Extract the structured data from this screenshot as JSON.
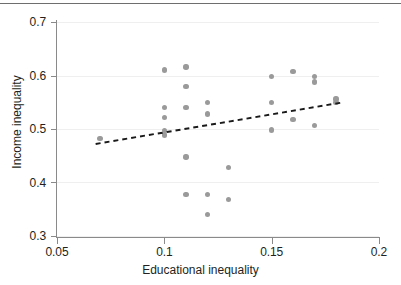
{
  "figure": {
    "name": "scatter-plot-educational-vs-income-inequality",
    "background": "#ffffff",
    "point_color": "#9a9a9a",
    "trendline_color": "#1a1a1a",
    "axis_color": "#8a8a8a",
    "grid_color": "#f0eff0"
  },
  "chart_data": {
    "type": "scatter",
    "title": "",
    "xlabel": "Educational inequality",
    "ylabel": "Income inequality",
    "xlim": [
      0.05,
      0.2
    ],
    "ylim": [
      0.3,
      0.7
    ],
    "xticks": [
      0.05,
      0.1,
      0.15,
      0.2
    ],
    "xticklabels": [
      "0.05",
      "0.1",
      "0.15",
      "0.2"
    ],
    "yticks": [
      0.3,
      0.4,
      0.5,
      0.6,
      0.7
    ],
    "yticklabels": [
      "0.3",
      "0.4",
      "0.5",
      "0.6",
      "0.7"
    ],
    "grid": "horizontal",
    "legend": "none",
    "marker": "circle",
    "points": [
      {
        "x": 0.07,
        "y": 0.482
      },
      {
        "x": 0.1,
        "y": 0.61
      },
      {
        "x": 0.1,
        "y": 0.54
      },
      {
        "x": 0.1,
        "y": 0.521
      },
      {
        "x": 0.1,
        "y": 0.497
      },
      {
        "x": 0.1,
        "y": 0.489
      },
      {
        "x": 0.11,
        "y": 0.616
      },
      {
        "x": 0.11,
        "y": 0.579
      },
      {
        "x": 0.11,
        "y": 0.54
      },
      {
        "x": 0.11,
        "y": 0.448
      },
      {
        "x": 0.11,
        "y": 0.378
      },
      {
        "x": 0.12,
        "y": 0.55
      },
      {
        "x": 0.12,
        "y": 0.528
      },
      {
        "x": 0.12,
        "y": 0.378
      },
      {
        "x": 0.12,
        "y": 0.34
      },
      {
        "x": 0.13,
        "y": 0.428
      },
      {
        "x": 0.13,
        "y": 0.368
      },
      {
        "x": 0.15,
        "y": 0.598
      },
      {
        "x": 0.15,
        "y": 0.549
      },
      {
        "x": 0.15,
        "y": 0.498
      },
      {
        "x": 0.16,
        "y": 0.608
      },
      {
        "x": 0.16,
        "y": 0.518
      },
      {
        "x": 0.17,
        "y": 0.598
      },
      {
        "x": 0.17,
        "y": 0.588
      },
      {
        "x": 0.17,
        "y": 0.507
      },
      {
        "x": 0.18,
        "y": 0.556
      },
      {
        "x": 0.18,
        "y": 0.549
      }
    ],
    "trendline": {
      "style": "dashed",
      "x_start": 0.068,
      "y_start": 0.472,
      "x_end": 0.182,
      "y_end": 0.549
    }
  }
}
